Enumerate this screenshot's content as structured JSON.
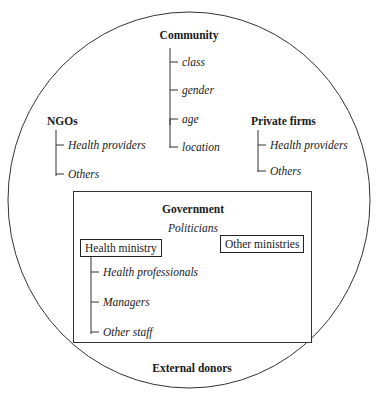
{
  "diagram": {
    "outer": "ellipse",
    "community": {
      "title": "Community",
      "items": [
        "class",
        "gender",
        "age",
        "location"
      ]
    },
    "ngos": {
      "title": "NGOs",
      "items": [
        "Health providers",
        "Others"
      ]
    },
    "private_firms": {
      "title": "Private firms",
      "items": [
        "Health providers",
        "Others"
      ]
    },
    "government": {
      "title": "Government",
      "subtitle": "Politicians",
      "health_ministry": {
        "label": "Health ministry",
        "items": [
          "Health professionals",
          "Managers",
          "Other staff"
        ]
      },
      "other_ministries": {
        "label": "Other ministries"
      }
    },
    "external_donors": {
      "title": "External donors"
    }
  }
}
